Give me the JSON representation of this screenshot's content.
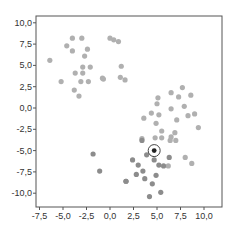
{
  "chart_data": {
    "type": "scatter",
    "title": "",
    "xlabel": "",
    "ylabel": "",
    "xlim": [
      -8.0,
      11.8
    ],
    "ylim": [
      -11.3,
      10.8
    ],
    "grid": false,
    "legend": null,
    "xticks": [
      -7.5,
      -5.0,
      -2.5,
      0.0,
      2.5,
      5.0,
      7.5,
      10.0
    ],
    "yticks": [
      10.0,
      7.5,
      5.0,
      2.5,
      0.0,
      -2.5,
      -5.0,
      -7.5,
      -10.0
    ],
    "xtick_labels": [
      "-7,5",
      "-5,0",
      "-2,5",
      "0,0",
      "2,5",
      "5,0",
      "7,5",
      "10,0"
    ],
    "ytick_labels": [
      "10,0",
      "7,5",
      "5,0",
      "2,5",
      "0,0",
      "-2,5",
      "-5,0",
      "-7,5",
      "-10,0"
    ],
    "series": [
      {
        "name": "cluster-upper-left",
        "color": "#b0b0b0",
        "points": [
          [
            -6.4,
            5.6
          ],
          [
            -4.0,
            8.2
          ],
          [
            -3.0,
            8.2
          ],
          [
            -4.6,
            7.3
          ],
          [
            -4.0,
            6.7
          ],
          [
            -2.4,
            6.9
          ],
          [
            -2.7,
            6.1
          ],
          [
            -2.9,
            4.8
          ],
          [
            -2.1,
            4.8
          ],
          [
            -3.7,
            4.1
          ],
          [
            -2.9,
            4.1
          ],
          [
            -5.2,
            3.1
          ],
          [
            -3.1,
            3.1
          ],
          [
            -2.3,
            3.1
          ],
          [
            -0.7,
            3.4
          ],
          [
            -3.8,
            2.1
          ],
          [
            -3.3,
            1.4
          ],
          [
            0.4,
            8.0
          ],
          [
            0.0,
            8.2
          ],
          [
            0.9,
            7.8
          ],
          [
            1.2,
            4.9
          ],
          [
            1.1,
            3.6
          ],
          [
            1.6,
            3.3
          ],
          [
            -0.8,
            3.5
          ]
        ]
      },
      {
        "name": "cluster-lower-right-light",
        "color": "#b0b0b0",
        "points": [
          [
            7.7,
            2.4
          ],
          [
            6.5,
            1.8
          ],
          [
            7.3,
            1.3
          ],
          [
            8.6,
            1.5
          ],
          [
            5.1,
            1.2
          ],
          [
            5.0,
            0.5
          ],
          [
            6.5,
            -0.1
          ],
          [
            7.9,
            0.2
          ],
          [
            4.4,
            -0.6
          ],
          [
            5.2,
            -0.8
          ],
          [
            3.6,
            -1.2
          ],
          [
            8.3,
            -0.9
          ],
          [
            9.0,
            -0.7
          ],
          [
            7.1,
            -1.4
          ],
          [
            4.9,
            -1.8
          ],
          [
            9.4,
            -2.3
          ],
          [
            5.5,
            -2.7
          ],
          [
            6.9,
            -2.9
          ],
          [
            4.8,
            -3.5
          ],
          [
            3.4,
            -3.6
          ],
          [
            6.5,
            -3.4
          ],
          [
            7.0,
            -3.8
          ],
          [
            5.5,
            -3.5
          ],
          [
            6.4,
            -3.8
          ],
          [
            8.0,
            -5.8
          ],
          [
            8.7,
            -6.5
          ],
          [
            6.2,
            -6.8
          ],
          [
            4.5,
            -5.2
          ]
        ]
      },
      {
        "name": "cluster-lower-right-dark",
        "color": "#8c8c8c",
        "points": [
          [
            3.4,
            -3.8
          ],
          [
            3.9,
            -5.5
          ],
          [
            4.7,
            -6.1
          ],
          [
            6.3,
            -5.8
          ],
          [
            2.4,
            -6.1
          ],
          [
            3.0,
            -6.7
          ],
          [
            5.2,
            -6.7
          ],
          [
            5.7,
            -6.8
          ],
          [
            3.5,
            -7.4
          ],
          [
            2.8,
            -7.8
          ],
          [
            4.9,
            -7.9
          ],
          [
            1.7,
            -8.6
          ],
          [
            3.7,
            -8.3
          ],
          [
            4.5,
            -8.9
          ],
          [
            5.4,
            -9.9
          ],
          [
            4.2,
            -10.4
          ],
          [
            -1.8,
            -5.4
          ],
          [
            -1.1,
            -7.4
          ],
          [
            1.7,
            -8.6
          ]
        ]
      }
    ],
    "highlighted_point": {
      "x": 4.7,
      "y": -5.0,
      "color": "#222222",
      "ring_color": "#444444"
    }
  }
}
